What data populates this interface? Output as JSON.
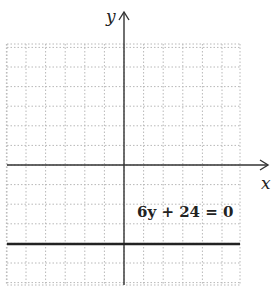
{
  "chart_data": {
    "type": "line",
    "title": "",
    "xlabel": "x",
    "ylabel": "y",
    "xlim": [
      -6,
      6
    ],
    "ylim": [
      -6,
      6
    ],
    "grid": true,
    "grid_style": "dotted",
    "series": [
      {
        "name": "6y + 24 = 0",
        "equation": "y = -4",
        "x": [
          -6,
          6
        ],
        "y": [
          -4,
          -4
        ]
      }
    ],
    "annotations": [
      {
        "text": "6y + 24 = 0",
        "x": 2.7,
        "y": -2.5
      }
    ]
  },
  "labels": {
    "x_axis": "x",
    "y_axis": "y",
    "equation": "6y + 24 = 0"
  },
  "colors": {
    "axis": "#333333",
    "grid": "#b8b8b8",
    "line": "#222222"
  }
}
